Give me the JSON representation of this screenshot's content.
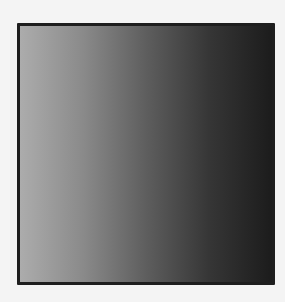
{
  "canvas": {
    "background": "#f4f4f4"
  },
  "square": {
    "border_color": "#1e1e1e",
    "gradient": {
      "direction": "to right",
      "stops": [
        {
          "color": "#acacac",
          "pos": "0%"
        },
        {
          "color": "#8a8a8a",
          "pos": "25%"
        },
        {
          "color": "#5e5e5e",
          "pos": "50%"
        },
        {
          "color": "#363636",
          "pos": "75%"
        },
        {
          "color": "#1c1c1c",
          "pos": "100%"
        }
      ]
    }
  }
}
